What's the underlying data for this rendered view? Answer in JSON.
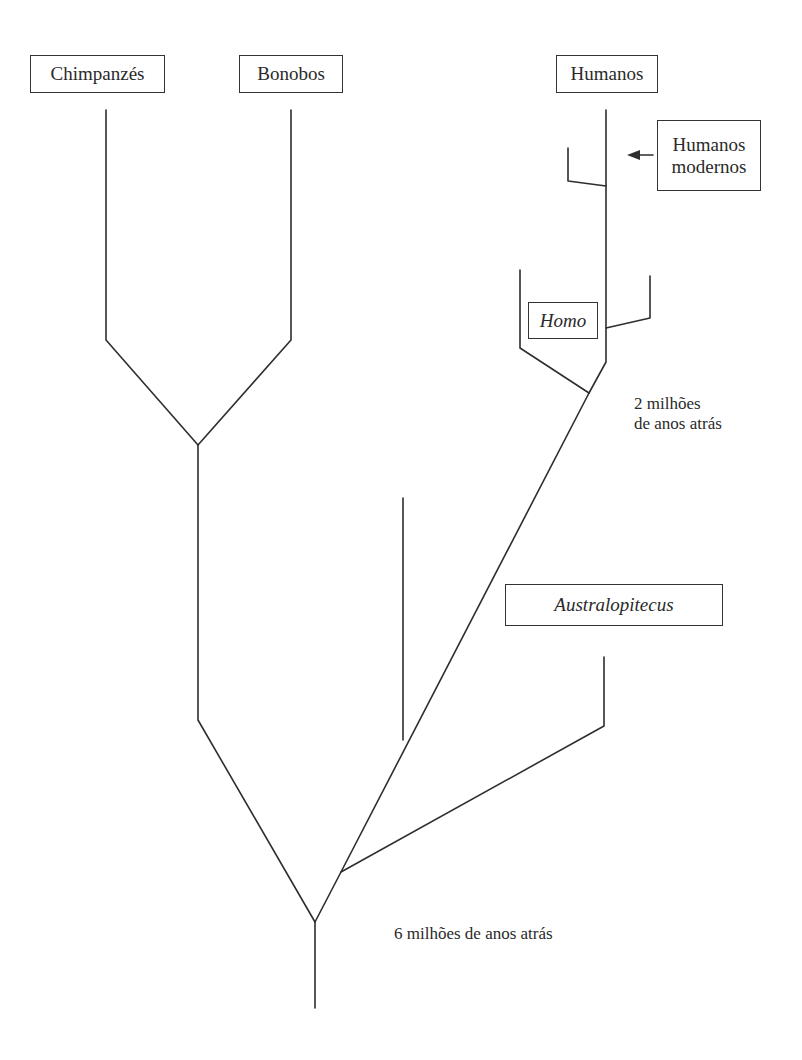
{
  "diagram": {
    "type": "phylogenetic-tree",
    "nodes": {
      "chimpanzees": {
        "label": "Chimpanzés"
      },
      "bonobos": {
        "label": "Bonobos"
      },
      "humans": {
        "label": "Humanos"
      },
      "modern_humans": {
        "label_line1": "Humanos",
        "label_line2": "modernos"
      },
      "homo": {
        "label": "Homo"
      },
      "australopithecus": {
        "label": "Australopitecus"
      }
    },
    "time_markers": {
      "two_million": {
        "line1": "2 milhões",
        "line2": "de anos atrás"
      },
      "six_million": {
        "text": "6 milhões de anos atrás"
      }
    },
    "relationships": [
      {
        "from": "root",
        "to": "chimp-bonobo-ancestor"
      },
      {
        "from": "root",
        "to": "australopithecus"
      },
      {
        "from": "root",
        "to": "homo-ancestor"
      },
      {
        "from": "chimp-bonobo-ancestor",
        "to": "chimpanzees"
      },
      {
        "from": "chimp-bonobo-ancestor",
        "to": "bonobos"
      },
      {
        "from": "homo-ancestor",
        "to": "homo"
      },
      {
        "from": "homo-ancestor",
        "to": "humans"
      }
    ]
  }
}
